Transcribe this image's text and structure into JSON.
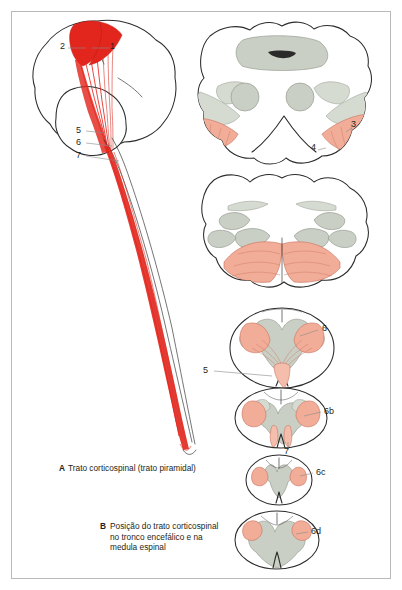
{
  "figure": {
    "title_a": "Trato corticospinal (trato piramidal)",
    "letter_a": "A",
    "letter_b": "B",
    "title_b_line1": "Posição do trato corticospinal",
    "title_b_line2": "no tronco encefálico e na",
    "title_b_line3": "medula espinal",
    "language": "pt-BR"
  },
  "colors": {
    "tract_bright_red": "#e3261d",
    "tract_salmon": "#f2ad98",
    "gray_matter": "#c9cfc4",
    "outline": "#2b2b2b",
    "frame_border": "#b9b9b9",
    "page_background": "#ffffff",
    "label_text": "#231f20"
  },
  "panel_a": {
    "name": "sagittal-brain-and-spinal-cord",
    "numbers": [
      {
        "id": "1",
        "x": 112,
        "y": 47
      },
      {
        "id": "2",
        "x": 63,
        "y": 47
      },
      {
        "id": "5",
        "x": 79,
        "y": 131
      },
      {
        "id": "6",
        "x": 79,
        "y": 143
      },
      {
        "id": "7",
        "x": 79,
        "y": 156
      }
    ]
  },
  "panel_b": {
    "name": "brainstem-and-spinal-cord-cross-sections",
    "sections": [
      {
        "name": "midbrain",
        "numbers": [
          "3",
          "4"
        ]
      },
      {
        "name": "pons",
        "numbers": []
      },
      {
        "name": "medulla-oblongata",
        "numbers": [
          "5",
          "6"
        ]
      },
      {
        "name": "cervical-spinal-cord",
        "numbers": [
          "6",
          "7"
        ]
      },
      {
        "name": "thoracic-spinal-cord",
        "numbers": [
          "6",
          "7"
        ]
      },
      {
        "name": "lumbar-spinal-cord",
        "numbers": [
          "6"
        ]
      }
    ],
    "numbers": [
      {
        "id": "3",
        "x": 353,
        "y": 126
      },
      {
        "id": "4",
        "x": 316,
        "y": 148
      },
      {
        "id": "6",
        "x": 322,
        "y": 328
      },
      {
        "id": "5",
        "x": 207,
        "y": 371
      },
      {
        "id": "6b",
        "x": 325,
        "y": 411
      },
      {
        "id": "7",
        "x": 285,
        "y": 452
      },
      {
        "id": "6c",
        "x": 317,
        "y": 472
      },
      {
        "id": "6d",
        "x": 312,
        "y": 531
      }
    ]
  }
}
